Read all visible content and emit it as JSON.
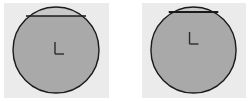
{
  "figure": {
    "background_color": "#ffffff",
    "width": 251,
    "height": 101
  },
  "colors": {
    "panel_background": "#ebebeb",
    "circle_fill": "#a9a9a9",
    "cap_fill": "#c9c9c9",
    "outline": "#1a1a1a",
    "chord": "#1a1a1a",
    "center_mark": "#2b2b2b",
    "page_background": "#ffffff"
  },
  "panels": [
    {
      "id": "panel-left",
      "name": "left-panel",
      "circle": {
        "center_x": 52,
        "center_y": 47,
        "radius": 43,
        "fill": "#a9a9a9",
        "stroke": "#1a1a1a",
        "stroke_width": 1.4
      },
      "chord": {
        "y": 13,
        "x_start": 22,
        "x_end": 82,
        "stroke": "#1a1a1a",
        "stroke_width": 1.4
      },
      "cap": {
        "fill": "#c9c9c9",
        "label": "circular-segment-above-chord"
      },
      "center_mark": {
        "label": "L",
        "x": 51,
        "y": 45,
        "vertical_length": 12,
        "horizontal_length": 9,
        "stroke": "#2b2b2b",
        "stroke_width": 1.4
      }
    },
    {
      "id": "panel-right",
      "name": "right-panel",
      "circle": {
        "center_x": 52,
        "center_y": 47,
        "radius": 43,
        "fill": "#a9a9a9",
        "stroke": "#1a1a1a",
        "stroke_width": 1.4
      },
      "chord": {
        "y": 9,
        "x_start": 27,
        "x_end": 77,
        "stroke": "#1a1a1a",
        "stroke_width": 1.8
      },
      "cap": {
        "fill": "#c9c9c9",
        "label": "circular-segment-above-chord"
      },
      "center_mark": {
        "label": "L",
        "x": 48,
        "y": 35,
        "vertical_length": 12,
        "horizontal_length": 9,
        "stroke": "#2b2b2b",
        "stroke_width": 1.4
      }
    }
  ]
}
